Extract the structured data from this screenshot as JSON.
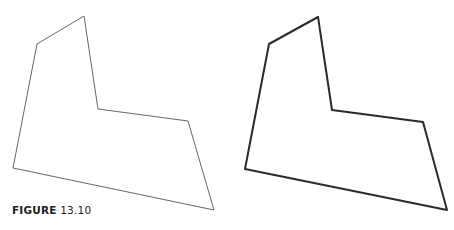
{
  "figure": {
    "caption_label": "FIGURE",
    "caption_number": "13.10"
  },
  "polygons": [
    {
      "name": "thin-outline-polygon",
      "points": [
        [
          37,
          44
        ],
        [
          84,
          16
        ],
        [
          98,
          109
        ],
        [
          188,
          121
        ],
        [
          214,
          210
        ],
        [
          13,
          168
        ]
      ],
      "stroke": "#666666",
      "stroke_width": 1
    },
    {
      "name": "thick-outline-polygon",
      "points": [
        [
          269,
          44
        ],
        [
          318,
          17
        ],
        [
          332,
          110
        ],
        [
          423,
          122
        ],
        [
          447,
          210
        ],
        [
          245,
          169
        ]
      ],
      "stroke": "#2a2a2a",
      "stroke_width": 2
    }
  ]
}
